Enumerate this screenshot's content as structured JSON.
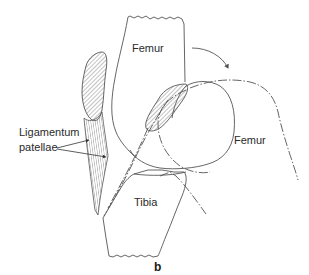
{
  "figure": {
    "panel_label": "b",
    "labels": {
      "femur_upper": "Femur",
      "femur_lower": "Femur",
      "tibia": "Tibia",
      "ligament_line1": "Ligamentum",
      "ligament_line2": "patellae"
    },
    "colors": {
      "outline": "#555555",
      "text": "#2a2a2a",
      "background": "#ffffff"
    }
  }
}
